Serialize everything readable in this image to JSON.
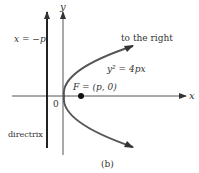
{
  "figure": {
    "caption": "(b)",
    "labels": {
      "y_axis": "y",
      "x_axis": "x",
      "directrix_eq": "x = −p",
      "directrix": "directrix",
      "origin": "0",
      "focus": "F = (p, 0)",
      "equation": "y² = 4px",
      "opening": "to the right"
    },
    "colors": {
      "axis": "#555555",
      "directrix": "#222222",
      "curve": "#555555",
      "text": "#333333"
    }
  }
}
